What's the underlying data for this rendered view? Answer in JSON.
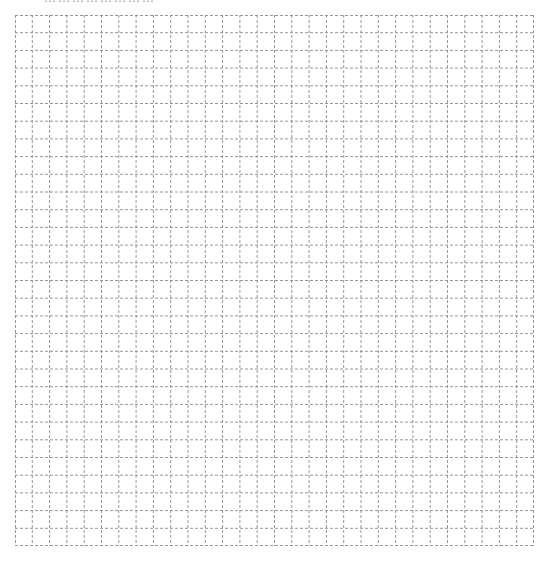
{
  "page": {
    "clipped_heading": "……………………",
    "grid": {
      "columns": 30,
      "rows": 30,
      "line_color": "#8c8c8c",
      "line_style": "dashed"
    }
  }
}
